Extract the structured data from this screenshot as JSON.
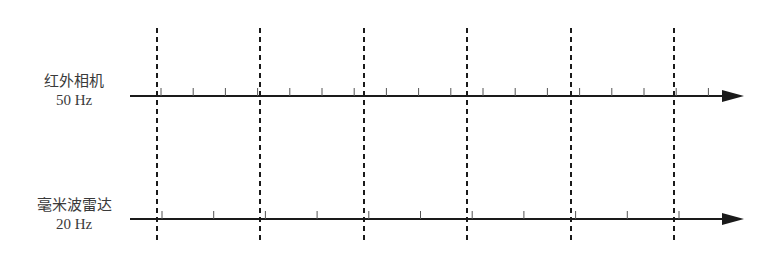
{
  "diagram": {
    "title": "",
    "sensors": [
      {
        "name": "红外相机",
        "rate": "50 Hz",
        "axis_y": 96,
        "tick_start": 161,
        "tick_step": 32.2,
        "tick_count": 18
      },
      {
        "name": "毫米波雷达",
        "rate": "20 Hz",
        "axis_y": 219,
        "tick_start": 162,
        "tick_step": 51.7,
        "tick_count": 12
      }
    ],
    "sync_lines_x": [
      157,
      260,
      364,
      467,
      571,
      674
    ],
    "sync_line_top": 28,
    "sync_line_bottom": 240,
    "axis_start_x": 130,
    "axis_arrow_tip_x": 744,
    "colors": {
      "line": "#1a1a1a",
      "text": "#3a3a3a",
      "background": "#ffffff"
    }
  }
}
